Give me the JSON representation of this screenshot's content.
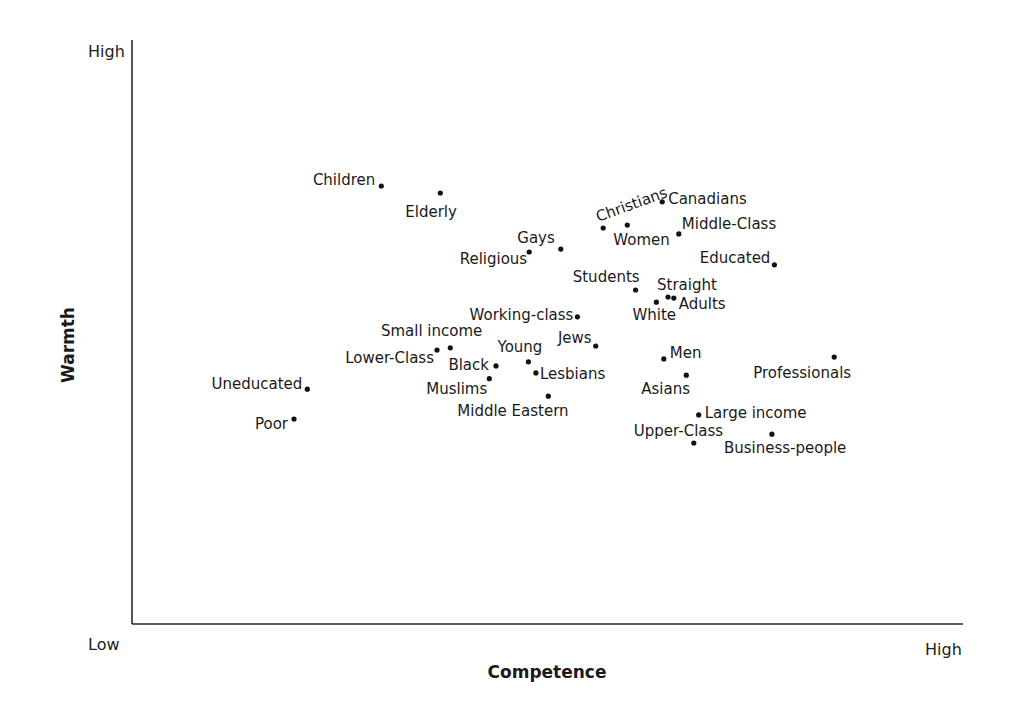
{
  "chart_data": {
    "type": "scatter",
    "title": "",
    "xlabel": "Competence",
    "ylabel": "Warmth",
    "x_ticks": {
      "low": "Low",
      "high": "High"
    },
    "y_ticks": {
      "low": "Low",
      "high": "High"
    },
    "xlim": [
      0,
      100
    ],
    "ylim": [
      0,
      100
    ],
    "grid": false,
    "legend": null,
    "points": [
      {
        "label": "Children",
        "x": 30.0,
        "y": 75.0,
        "lx": -6,
        "ly": -1,
        "anchor": "end"
      },
      {
        "label": "Elderly",
        "x": 37.1,
        "y": 73.8,
        "lx": -10,
        "ly": 24,
        "anchor": "start",
        "dx_abs": -35
      },
      {
        "label": "Christians",
        "x": 56.7,
        "y": 67.8,
        "lx": -5,
        "ly": -6,
        "anchor": "start",
        "rotate": -20
      },
      {
        "label": "Women",
        "x": 59.6,
        "y": 68.3,
        "lx": -14,
        "ly": 20,
        "anchor": "start"
      },
      {
        "label": "Canadians",
        "x": 63.8,
        "y": 72.3,
        "lx": 6,
        "ly": 2,
        "anchor": "start"
      },
      {
        "label": "Middle-Class",
        "x": 65.8,
        "y": 66.8,
        "lx": 3,
        "ly": -5,
        "anchor": "start"
      },
      {
        "label": "Gays",
        "x": 51.6,
        "y": 64.2,
        "lx": -6,
        "ly": -6,
        "anchor": "end"
      },
      {
        "label": "Religious",
        "x": 47.8,
        "y": 63.7,
        "lx": -2,
        "ly": 12,
        "anchor": "end"
      },
      {
        "label": "Educated",
        "x": 77.3,
        "y": 61.5,
        "lx": -4,
        "ly": -2,
        "anchor": "end"
      },
      {
        "label": "Students",
        "x": 60.6,
        "y": 57.2,
        "lx": 4,
        "ly": -8,
        "anchor": "end"
      },
      {
        "label": "Straight",
        "x": 64.5,
        "y": 56.0,
        "lx": -11,
        "ly": -7,
        "anchor": "start"
      },
      {
        "label": "Adults",
        "x": 65.2,
        "y": 55.8,
        "lx": 5,
        "ly": 11,
        "anchor": "start"
      },
      {
        "label": "White",
        "x": 63.1,
        "y": 55.1,
        "lx": -24,
        "ly": 18,
        "anchor": "start"
      },
      {
        "label": "Working-class",
        "x": 53.6,
        "y": 52.6,
        "lx": -4,
        "ly": 3,
        "anchor": "end"
      },
      {
        "label": "Jews",
        "x": 55.8,
        "y": 47.6,
        "lx": -4,
        "ly": -3,
        "anchor": "end"
      },
      {
        "label": "Small income",
        "x": 38.3,
        "y": 47.3,
        "lx": 32,
        "ly": -12,
        "anchor": "end"
      },
      {
        "label": "Lower-Class",
        "x": 36.7,
        "y": 46.9,
        "lx": -3,
        "ly": 13,
        "anchor": "end"
      },
      {
        "label": "Young",
        "x": 47.7,
        "y": 44.9,
        "lx": 14,
        "ly": -10,
        "anchor": "end"
      },
      {
        "label": "Black",
        "x": 43.8,
        "y": 44.2,
        "lx": -7,
        "ly": 4,
        "anchor": "end"
      },
      {
        "label": "Lesbians",
        "x": 48.6,
        "y": 43.0,
        "lx": 4,
        "ly": 6,
        "anchor": "start"
      },
      {
        "label": "Muslims",
        "x": 43.0,
        "y": 42.0,
        "lx": -2,
        "ly": 15,
        "anchor": "end"
      },
      {
        "label": "Middle Eastern",
        "x": 50.1,
        "y": 39.0,
        "lx": -91,
        "ly": 20,
        "anchor": "start"
      },
      {
        "label": "Men",
        "x": 64.0,
        "y": 45.4,
        "lx": 6,
        "ly": -1,
        "anchor": "start"
      },
      {
        "label": "Asians",
        "x": 66.7,
        "y": 42.6,
        "lx": -45,
        "ly": 19,
        "anchor": "start"
      },
      {
        "label": "Professionals",
        "x": 84.5,
        "y": 45.7,
        "lx": -81,
        "ly": 21,
        "anchor": "start"
      },
      {
        "label": "Large income",
        "x": 68.2,
        "y": 35.8,
        "lx": 6,
        "ly": 3,
        "anchor": "start"
      },
      {
        "label": "Upper-Class",
        "x": 67.6,
        "y": 31.0,
        "lx": -60,
        "ly": -7,
        "anchor": "start"
      },
      {
        "label": "Business-people",
        "x": 77.0,
        "y": 32.5,
        "lx": -48,
        "ly": 19,
        "anchor": "start"
      },
      {
        "label": "Uneducated",
        "x": 21.1,
        "y": 40.2,
        "lx": -5,
        "ly": 0,
        "anchor": "end"
      },
      {
        "label": "Poor",
        "x": 19.5,
        "y": 35.1,
        "lx": -6,
        "ly": 10,
        "anchor": "end"
      }
    ]
  },
  "colors": {
    "axis": "#2a2a2a",
    "point": "#111111",
    "text": "#1a1a1a"
  }
}
